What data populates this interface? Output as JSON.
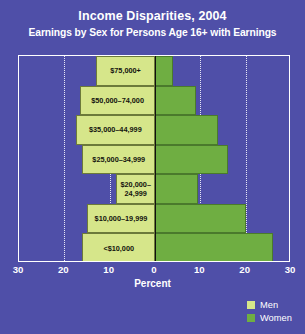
{
  "header": {
    "title": "Income Disparities, 2004",
    "subtitle": "Earnings by Sex for Persons Age 16+ with Earnings"
  },
  "axis": {
    "title": "Percent",
    "ticks": [
      "30",
      "20",
      "10",
      "0",
      "10",
      "20",
      "30"
    ]
  },
  "legend": {
    "items": [
      {
        "label": "Men",
        "color": "#d6e68a"
      },
      {
        "label": "Women",
        "color": "#6fae42"
      }
    ]
  },
  "colors": {
    "background": "#4f4fa8",
    "men": "#d6e68a",
    "women": "#6fae42",
    "frame": "#ffffff",
    "gridline": "#e8e8f6",
    "zero_axis": "#10100f",
    "text_light": "#ffffff",
    "text_dark": "#14140f"
  },
  "chart_data": {
    "type": "bar",
    "title": "Income Disparities, 2004",
    "subtitle": "Earnings by Sex for Persons Age 16+ with Earnings",
    "orientation": "horizontal",
    "layout": "population-pyramid",
    "xlabel": "Percent",
    "ylabel": "",
    "xlim": [
      -30,
      30
    ],
    "xticks": [
      -30,
      -20,
      -10,
      0,
      10,
      20,
      30
    ],
    "xticklabels": [
      "30",
      "20",
      "10",
      "0",
      "10",
      "20",
      "30"
    ],
    "grid": "vertical dotted at 20 and 10 on both sides",
    "legend_position": "bottom-right outside",
    "categories": [
      "$75,000+",
      "$50,000–74,000",
      "$35,000–44,999",
      "$25,000–34,999",
      "$20,000–\n24,999",
      "$10,000–19,999",
      "<$10,000"
    ],
    "series": [
      {
        "name": "Men",
        "direction": "left",
        "values": [
          13.0,
          16.5,
          17.5,
          16.0,
          8.5,
          15.0,
          16.0
        ]
      },
      {
        "name": "Women",
        "direction": "right",
        "values": [
          4.0,
          9.0,
          14.0,
          16.0,
          9.5,
          20.0,
          26.0
        ]
      }
    ]
  }
}
